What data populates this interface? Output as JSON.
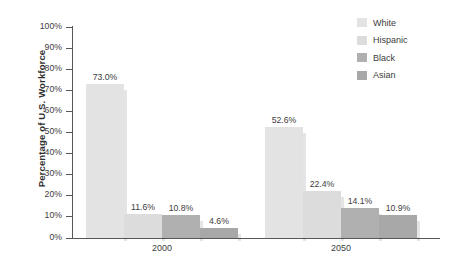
{
  "chart_data": {
    "type": "bar",
    "title": "",
    "xlabel": "",
    "ylabel": "Percentage of U.S. Workforce",
    "categories": [
      "2000",
      "2050"
    ],
    "ylim": [
      0,
      100
    ],
    "ytick_labels": [
      "0%",
      "10%",
      "20%",
      "30%",
      "40%",
      "50%",
      "60%",
      "70%",
      "80%",
      "90%",
      "100%"
    ],
    "ytick_values": [
      0,
      10,
      20,
      30,
      40,
      50,
      60,
      70,
      80,
      90,
      100
    ],
    "grid": false,
    "legend_position": "top-right",
    "value_label_suffix": "%",
    "series": [
      {
        "name": "White",
        "color": "#e3e3e3",
        "values": [
          73.0,
          52.6
        ],
        "labels": [
          "73.0%",
          "52.6%"
        ]
      },
      {
        "name": "Hispanic",
        "color": "#dcdcdc",
        "values": [
          11.6,
          22.4
        ],
        "labels": [
          "11.6%",
          "22.4%"
        ]
      },
      {
        "name": "Black",
        "color": "#b0b0b0",
        "values": [
          10.8,
          14.1
        ],
        "labels": [
          "10.8%",
          "14.1%"
        ]
      },
      {
        "name": "Asian",
        "color": "#a8a8a8",
        "values": [
          4.6,
          10.9
        ],
        "labels": [
          "4.6%",
          "10.9%"
        ]
      }
    ]
  },
  "legend": {
    "items": [
      {
        "label": "White",
        "color": "#e3e3e3"
      },
      {
        "label": "Hispanic",
        "color": "#dcdcdc"
      },
      {
        "label": "Black",
        "color": "#b0b0b0"
      },
      {
        "label": "Asian",
        "color": "#a8a8a8"
      }
    ]
  },
  "axis": {
    "y_title": "Percentage of U.S. Workforce",
    "x_labels": [
      "2000",
      "2050"
    ]
  },
  "colors": {
    "axis": "#58585a",
    "text": "#3d3d3d",
    "background": "#ffffff"
  }
}
